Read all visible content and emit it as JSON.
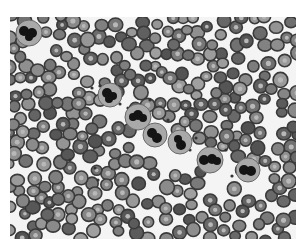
{
  "image": {
    "kind": "peripheral blood smear micrograph",
    "colors": {
      "background": "#ffffff",
      "field": "#f4f4f4",
      "rbc_light": "#9a9a9a",
      "rbc_dark": "#5e5e5e",
      "nucleus": "#141414"
    },
    "frame": {
      "x": 10,
      "y": 17,
      "width": 286,
      "height": 222
    }
  },
  "wbcs": [
    {
      "cx": 29,
      "cy": 33,
      "r": 13,
      "lobes": [
        [
          -5,
          -2,
          5
        ],
        [
          3,
          0,
          5
        ],
        [
          0,
          4,
          4
        ]
      ]
    },
    {
      "cx": 110,
      "cy": 95,
      "r": 12,
      "lobes": [
        [
          -3,
          -2,
          5
        ],
        [
          3,
          1,
          4
        ],
        [
          -1,
          4,
          4
        ]
      ]
    },
    {
      "cx": 138,
      "cy": 117,
      "r": 13,
      "lobes": [
        [
          -5,
          0,
          4
        ],
        [
          0,
          -2,
          5
        ],
        [
          5,
          1,
          4
        ]
      ]
    },
    {
      "cx": 155,
      "cy": 135,
      "r": 12,
      "lobes": [
        [
          -3,
          -2,
          5
        ],
        [
          2,
          3,
          5
        ]
      ]
    },
    {
      "cx": 180,
      "cy": 142,
      "r": 12,
      "lobes": [
        [
          -2,
          -3,
          4
        ],
        [
          1,
          3,
          5
        ]
      ]
    },
    {
      "cx": 210,
      "cy": 160,
      "r": 13,
      "lobes": [
        [
          -6,
          0,
          5
        ],
        [
          2,
          -1,
          5
        ],
        [
          7,
          1,
          4
        ]
      ]
    },
    {
      "cx": 248,
      "cy": 170,
      "r": 12,
      "lobes": [
        [
          -4,
          0,
          5
        ],
        [
          3,
          1,
          5
        ]
      ]
    }
  ],
  "platelets": [
    [
      92,
      88
    ],
    [
      100,
      86
    ],
    [
      120,
      104
    ],
    [
      128,
      108
    ],
    [
      150,
      100
    ],
    [
      160,
      128
    ],
    [
      168,
      120
    ],
    [
      190,
      150
    ],
    [
      196,
      138
    ],
    [
      226,
      150
    ],
    [
      232,
      176
    ],
    [
      95,
      168
    ],
    [
      98,
      180
    ],
    [
      62,
      150
    ],
    [
      70,
      160
    ]
  ]
}
